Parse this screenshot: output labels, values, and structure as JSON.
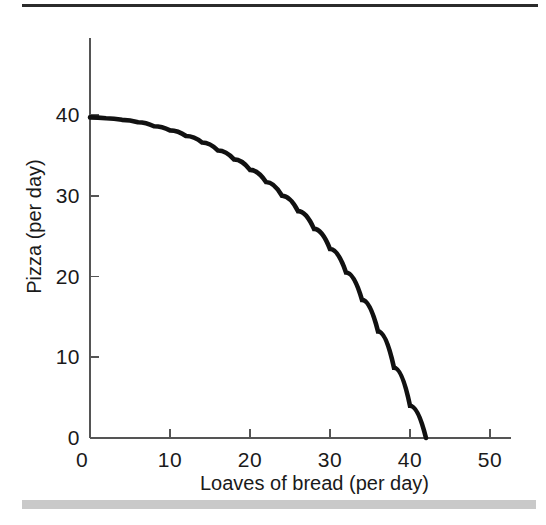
{
  "figure": {
    "background_color": "#ffffff",
    "top_rule_color": "#2b2b2b",
    "bottom_bar_color": "#c9c9c9"
  },
  "chart_data": {
    "type": "line",
    "title": "",
    "subtitle": "",
    "xlabel": "Loaves of bread (per day)",
    "ylabel": "Pizza (per day)",
    "xlim": [
      0,
      52
    ],
    "ylim": [
      0,
      45
    ],
    "xticks": [
      0,
      10,
      20,
      30,
      40,
      50
    ],
    "yticks": [
      0,
      10,
      20,
      30,
      40
    ],
    "xtick_labels": [
      "0",
      "10",
      "20",
      "30",
      "40",
      "50"
    ],
    "ytick_labels": [
      "0",
      "10",
      "20",
      "30",
      "40"
    ],
    "grid": false,
    "legend": null,
    "annotations": [],
    "series": [
      {
        "name": "Production possibilities frontier",
        "color": "#111111",
        "line_width": 4.6,
        "x": [
          0,
          2,
          4,
          6,
          8,
          10,
          12,
          14,
          16,
          18,
          20,
          22,
          24,
          26,
          28,
          30,
          32,
          34,
          36,
          38,
          40,
          42,
          44,
          45,
          46,
          47,
          47.5,
          48
        ],
        "y": [
          39.7,
          39.6,
          39.4,
          39.1,
          38.6,
          38.1,
          37.4,
          36.6,
          35.6,
          34.5,
          33.2,
          31.7,
          30.0,
          28.1,
          25.9,
          23.4,
          20.5,
          17.1,
          13.2,
          8.7,
          4.0,
          0.0,
          0.0,
          0.0,
          0.0,
          0.0,
          0.0,
          0.0
        ],
        "shape_note": "quarter-ellipse: y = 40 * sqrt(1 - (x/48)^2)"
      }
    ]
  }
}
